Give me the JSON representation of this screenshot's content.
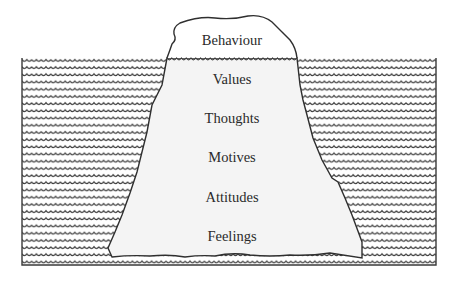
{
  "diagram": {
    "type": "iceberg",
    "colors": {
      "water_line": "#3a3a3a",
      "iceberg_fill": "#f4f4f4",
      "outline": "#2f2f2f",
      "text": "#2a2a2a",
      "background": "#ffffff"
    },
    "above_water": {
      "label": "Behaviour"
    },
    "below_water": {
      "labels": [
        "Values",
        "Thoughts",
        "Motives",
        "Attitudes",
        "Feelings"
      ]
    }
  }
}
